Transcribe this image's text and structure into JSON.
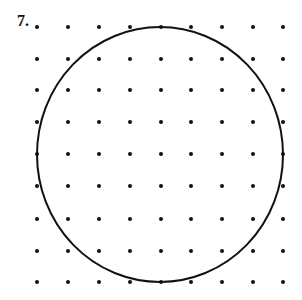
{
  "problem": {
    "number": "7."
  },
  "grid": {
    "columns_x": [
      37,
      68,
      99,
      130,
      161,
      191,
      222,
      253,
      283
    ],
    "rows_y": [
      27,
      59,
      90,
      122,
      154,
      186,
      219,
      251,
      282
    ],
    "dot_radius": 2,
    "dot_color": "#111111"
  },
  "shape": {
    "type": "circle",
    "cx": 160,
    "cy": 154.5,
    "rx": 123,
    "ry": 127.5,
    "stroke": "#111111",
    "stroke_width": 2
  }
}
